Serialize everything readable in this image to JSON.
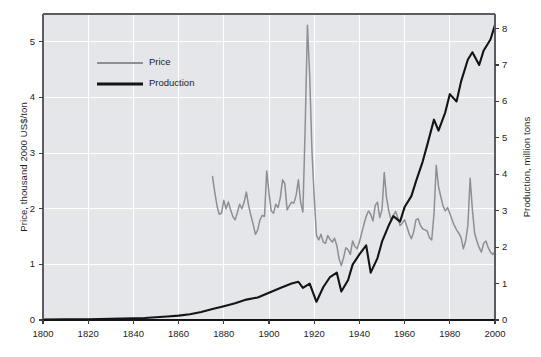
{
  "chart_data": {
    "type": "line",
    "title": "",
    "xlabel": "",
    "ylabel": "Price, thousand 2000 US$/ton",
    "ylabel_right": "Production, million tons",
    "xlim": [
      1800,
      2000
    ],
    "ylim": [
      0,
      5.5
    ],
    "ylim_right": [
      0,
      8.4
    ],
    "grid": true,
    "legend_position": "upper-left-inside",
    "xticks": [
      1800,
      1820,
      1840,
      1860,
      1880,
      1900,
      1920,
      1940,
      1960,
      1980,
      2000
    ],
    "xticklabels": [
      "1800",
      "1820",
      "1840",
      "1860",
      "1880",
      "1900",
      "1920",
      "1940",
      "1960",
      "1980",
      "2000"
    ],
    "yticks": [
      0,
      1,
      2,
      3,
      4,
      5
    ],
    "yticklabels": [
      "0",
      "1",
      "2",
      "3",
      "4",
      "5"
    ],
    "yticks_right": [
      0,
      1,
      2,
      3,
      4,
      5,
      6,
      7,
      8
    ],
    "yticklabels_right": [
      "0",
      "1",
      "2",
      "3",
      "4",
      "5",
      "6",
      "7",
      "8"
    ],
    "colors": {
      "price": "#8c8f94",
      "production": "#141414",
      "plot_background": "#e4e6ea",
      "gridline": "#ffffff",
      "axis": "#5a5c60",
      "text": "#1d1d1d"
    },
    "series": [
      {
        "name": "Price",
        "axis": "left",
        "units": "thousand 2000 US$/ton",
        "color": "#8c8f94",
        "x": [
          1875,
          1876,
          1877,
          1878,
          1879,
          1880,
          1881,
          1882,
          1883,
          1884,
          1885,
          1886,
          1887,
          1888,
          1889,
          1890,
          1891,
          1892,
          1893,
          1894,
          1895,
          1896,
          1897,
          1898,
          1899,
          1900,
          1901,
          1902,
          1903,
          1904,
          1905,
          1906,
          1907,
          1908,
          1909,
          1910,
          1911,
          1912,
          1913,
          1914,
          1915,
          1916,
          1917,
          1918,
          1919,
          1920,
          1921,
          1922,
          1923,
          1924,
          1925,
          1926,
          1927,
          1928,
          1929,
          1930,
          1931,
          1932,
          1933,
          1934,
          1935,
          1936,
          1937,
          1938,
          1939,
          1940,
          1941,
          1942,
          1943,
          1944,
          1945,
          1946,
          1947,
          1948,
          1949,
          1950,
          1951,
          1952,
          1953,
          1954,
          1955,
          1956,
          1957,
          1958,
          1959,
          1960,
          1961,
          1962,
          1963,
          1964,
          1965,
          1966,
          1967,
          1968,
          1969,
          1970,
          1971,
          1972,
          1973,
          1974,
          1975,
          1976,
          1977,
          1978,
          1979,
          1980,
          1981,
          1982,
          1983,
          1984,
          1985,
          1986,
          1987,
          1988,
          1989,
          1990,
          1991,
          1992,
          1993,
          1994,
          1995,
          1996,
          1997,
          1998,
          1999,
          2000
        ],
        "values": [
          2.58,
          2.3,
          2.05,
          1.9,
          1.92,
          2.15,
          2.0,
          2.12,
          1.98,
          1.86,
          1.8,
          1.93,
          2.08,
          2.0,
          2.12,
          2.3,
          2.05,
          1.88,
          1.72,
          1.54,
          1.62,
          1.8,
          1.88,
          1.86,
          2.68,
          2.28,
          1.96,
          1.92,
          2.08,
          2.02,
          2.2,
          2.52,
          2.45,
          1.98,
          2.05,
          2.12,
          2.1,
          2.24,
          2.52,
          2.12,
          1.94,
          3.45,
          5.3,
          4.4,
          3.05,
          2.22,
          1.52,
          1.44,
          1.54,
          1.4,
          1.38,
          1.52,
          1.45,
          1.4,
          1.47,
          1.34,
          1.1,
          0.98,
          1.12,
          1.3,
          1.26,
          1.18,
          1.42,
          1.32,
          1.28,
          1.4,
          1.56,
          1.72,
          1.86,
          1.96,
          1.9,
          1.78,
          2.06,
          2.12,
          1.84,
          1.98,
          2.65,
          2.2,
          1.96,
          1.8,
          1.88,
          1.95,
          1.84,
          1.7,
          1.74,
          1.8,
          1.68,
          1.55,
          1.46,
          1.58,
          1.8,
          1.82,
          1.7,
          1.64,
          1.62,
          1.6,
          1.48,
          1.44,
          1.9,
          2.78,
          2.4,
          2.22,
          2.05,
          1.96,
          2.02,
          1.92,
          1.8,
          1.7,
          1.62,
          1.56,
          1.48,
          1.28,
          1.42,
          1.7,
          2.55,
          1.98,
          1.56,
          1.42,
          1.3,
          1.22,
          1.38,
          1.42,
          1.3,
          1.22,
          1.18,
          1.22
        ]
      },
      {
        "name": "Production",
        "axis": "right",
        "units": "million tons",
        "color": "#141414",
        "x": [
          1800,
          1810,
          1820,
          1830,
          1840,
          1845,
          1850,
          1855,
          1860,
          1865,
          1870,
          1875,
          1880,
          1885,
          1890,
          1895,
          1900,
          1905,
          1910,
          1913,
          1915,
          1918,
          1921,
          1924,
          1927,
          1930,
          1932,
          1935,
          1937,
          1940,
          1943,
          1945,
          1948,
          1950,
          1953,
          1955,
          1958,
          1960,
          1963,
          1965,
          1968,
          1970,
          1973,
          1975,
          1978,
          1980,
          1983,
          1985,
          1988,
          1990,
          1993,
          1995,
          1998,
          2000
        ],
        "values": [
          0.015,
          0.018,
          0.022,
          0.03,
          0.045,
          0.055,
          0.075,
          0.095,
          0.12,
          0.16,
          0.22,
          0.3,
          0.38,
          0.46,
          0.56,
          0.62,
          0.75,
          0.88,
          1.0,
          1.05,
          0.88,
          1.0,
          0.5,
          0.9,
          1.18,
          1.3,
          0.78,
          1.1,
          1.52,
          1.8,
          2.05,
          1.3,
          1.7,
          2.15,
          2.6,
          2.85,
          2.7,
          3.1,
          3.4,
          3.8,
          4.35,
          4.8,
          5.5,
          5.2,
          5.7,
          6.2,
          6.0,
          6.55,
          7.15,
          7.35,
          7.0,
          7.4,
          7.7,
          8.1
        ]
      }
    ]
  },
  "legend": {
    "items": [
      {
        "label": "Price",
        "color": "#8c8f94"
      },
      {
        "label": "Production",
        "color": "#141414"
      }
    ]
  }
}
